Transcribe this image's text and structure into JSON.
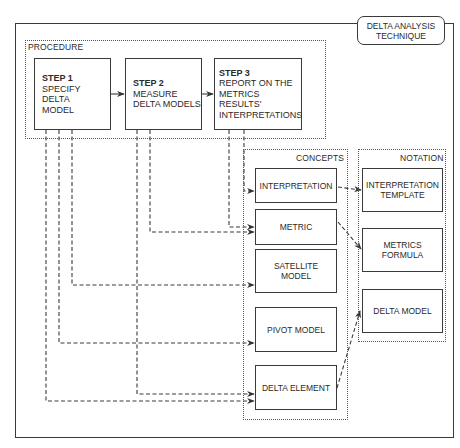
{
  "title": {
    "line1": "DELTA ANALYSIS",
    "line2": "TECHNIQUE"
  },
  "procedure": {
    "label": "PROCEDURE",
    "steps": [
      {
        "heading": "STEP 1",
        "lines": [
          "SPECIFY DELTA",
          "MODEL"
        ]
      },
      {
        "heading": "STEP 2",
        "lines": [
          "MEASURE",
          "DELTA MODELS"
        ]
      },
      {
        "heading": "STEP 3",
        "lines": [
          "REPORT ON THE",
          "METRICS",
          "RESULTS'",
          "INTERPRETATIONS"
        ]
      }
    ]
  },
  "concepts": {
    "label": "CONCEPTS",
    "items": [
      {
        "lines": [
          "INTERPRETATION"
        ]
      },
      {
        "lines": [
          "METRIC"
        ]
      },
      {
        "lines": [
          "SATELLITE",
          "MODEL"
        ]
      },
      {
        "lines": [
          "PIVOT MODEL"
        ]
      },
      {
        "lines": [
          "DELTA ELEMENT"
        ]
      }
    ]
  },
  "notation": {
    "label": "NOTATION",
    "items": [
      {
        "lines": [
          "INTERPRETATION",
          "TEMPLATE"
        ]
      },
      {
        "lines": [
          "METRICS",
          "FORMULA"
        ]
      },
      {
        "lines": [
          "DELTA MODEL"
        ]
      }
    ]
  },
  "connections": [
    {
      "from": "STEP 1",
      "to": "STEP 2",
      "style": "solid"
    },
    {
      "from": "STEP 2",
      "to": "STEP 3",
      "style": "solid"
    },
    {
      "from": "STEP 1",
      "to": "SATELLITE MODEL",
      "style": "dashed"
    },
    {
      "from": "STEP 1",
      "to": "PIVOT MODEL",
      "style": "dashed"
    },
    {
      "from": "STEP 1",
      "to": "DELTA ELEMENT",
      "style": "dashed"
    },
    {
      "from": "STEP 2",
      "to": "METRIC",
      "style": "dashed"
    },
    {
      "from": "STEP 2",
      "to": "DELTA ELEMENT",
      "style": "dashed"
    },
    {
      "from": "STEP 3",
      "to": "INTERPRETATION",
      "style": "dashed"
    },
    {
      "from": "STEP 3",
      "to": "METRIC",
      "style": "dashed"
    },
    {
      "from": "INTERPRETATION",
      "to": "INTERPRETATION TEMPLATE",
      "style": "dashed"
    },
    {
      "from": "METRIC",
      "to": "METRICS FORMULA",
      "style": "dashed"
    },
    {
      "from": "DELTA ELEMENT",
      "to": "DELTA MODEL",
      "style": "dashed"
    }
  ]
}
